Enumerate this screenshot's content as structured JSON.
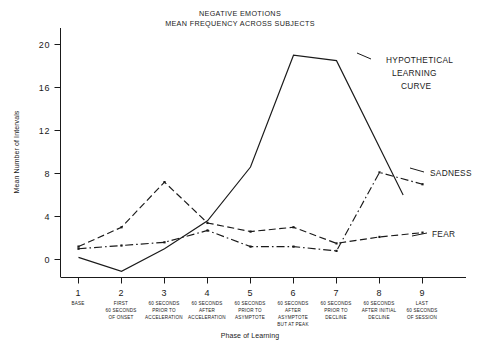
{
  "figure": {
    "title_lines": [
      "NEGATIVE EMOTIONS",
      "MEAN FREQUENCY ACROSS SUBJECTS"
    ],
    "y_axis_label": "Mean Number of Intervals",
    "x_axis_label": "Phase of Learning",
    "annotations": {
      "learning_curve": [
        "HYPOTHETICAL",
        "LEARNING",
        "CURVE"
      ],
      "sadness": "SADNESS",
      "fear": "FEAR"
    }
  },
  "chart_data": {
    "type": "line",
    "title": "NEGATIVE EMOTIONS\nMEAN FREQUENCY ACROSS SUBJECTS",
    "xlabel": "Phase of Learning",
    "ylabel": "Mean Number of Intervals",
    "ylim": [
      -2,
      22
    ],
    "yticks": [
      0,
      4,
      8,
      12,
      16,
      20
    ],
    "ytick_labels": [
      "0",
      "4",
      "8",
      "12",
      "16",
      "20"
    ],
    "xlim": [
      0.55,
      9.6
    ],
    "xticks": [
      1,
      2,
      3,
      4,
      5,
      6,
      7,
      8,
      9
    ],
    "xtick_labels": [
      "1",
      "2",
      "3",
      "4",
      "5",
      "6",
      "7",
      "8",
      "9"
    ],
    "grid": false,
    "legend_position": "inline-right-annotations",
    "x_categories": [
      [
        "BASE"
      ],
      [
        "FIRST",
        "60 SECONDS",
        "OF ONSET"
      ],
      [
        "60 SECONDS",
        "PRIOR TO",
        "ACCELERATION"
      ],
      [
        "60 SECONDS",
        "AFTER",
        "ACCELERATION"
      ],
      [
        "60 SECONDS",
        "PRIOR TO",
        "ASYMPTOTE"
      ],
      [
        "60 SECONDS",
        "AFTER",
        "ASYMPTOTE",
        "BUT AT PEAK"
      ],
      [
        "60 SECONDS",
        "PRIOR TO",
        "DECLINE"
      ],
      [
        "60 SECONDS",
        "AFTER INITIAL",
        "DECLINE"
      ],
      [
        "LAST",
        "60 SECONDS",
        "OF SESSION"
      ]
    ],
    "series": [
      {
        "name": "HYPOTHETICAL LEARNING CURVE",
        "style": "solid",
        "markers": false,
        "x": [
          1,
          2,
          3,
          4,
          5,
          6,
          7,
          8.55
        ],
        "values": [
          0.2,
          -1.1,
          1.0,
          3.6,
          8.6,
          19.0,
          18.5,
          6.0
        ]
      },
      {
        "name": "SADNESS",
        "style": "dash-dot",
        "markers": true,
        "x": [
          1,
          2,
          3,
          4,
          5,
          6,
          7,
          8,
          9
        ],
        "values": [
          1.0,
          1.3,
          1.6,
          2.7,
          1.2,
          1.2,
          0.8,
          8.1,
          7.0
        ]
      },
      {
        "name": "FEAR",
        "style": "dashed",
        "markers": true,
        "x": [
          1,
          2,
          3,
          4,
          5,
          6,
          7,
          8,
          9
        ],
        "values": [
          1.2,
          3.0,
          7.2,
          3.4,
          2.6,
          3.0,
          1.5,
          2.1,
          2.5
        ]
      }
    ]
  }
}
